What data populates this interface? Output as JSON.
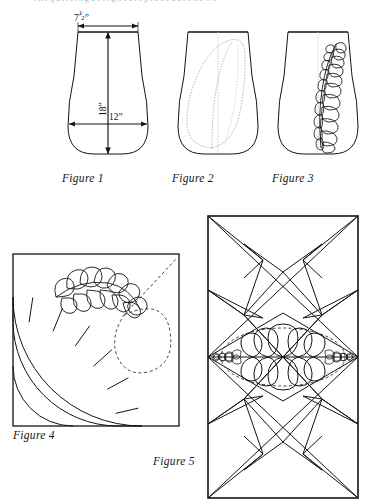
{
  "page": {
    "background": "#ffffff",
    "ink": "#141414",
    "dotted_ink": "#8f8f8f",
    "width": 371,
    "height": 504,
    "cut_off_header_text": "t h e   q u i l t i n g   d e s i g n s   a r e   p l a c e d   a s   s h o w n"
  },
  "figures": [
    {
      "id": "figure-1",
      "caption": "Figure 1",
      "kind": "vase-outline-with-dimensions",
      "description": "Bell / vase shaped quilting block outline with measurement arrows",
      "dimensions": [
        {
          "name": "top-width",
          "value": "7",
          "fraction_numerator": "1",
          "fraction_denominator": "2",
          "unit": "”",
          "orientation": "horizontal",
          "position": "top"
        },
        {
          "name": "height",
          "value": "18",
          "unit": "”",
          "orientation": "vertical",
          "position": "center"
        },
        {
          "name": "bottom-width",
          "value": "12",
          "unit": "”",
          "orientation": "horizontal",
          "position": "lower"
        }
      ]
    },
    {
      "id": "figure-2",
      "caption": "Figure 2",
      "kind": "vase-outline-with-dotted-feather-guide",
      "description": "Same vase outline with dotted teardrop feather placement guide and dotted center line"
    },
    {
      "id": "figure-3",
      "caption": "Figure 3",
      "kind": "vase-outline-with-drawn-feather-plume",
      "description": "Same vase outline with the finished feather plume drawn in along the right of the center line"
    },
    {
      "id": "figure-4",
      "caption": "Figure 4",
      "kind": "fan-block-with-corner-feather",
      "description": "Square pieced fan block, quarter circle of radial wedges from the lower-left corner, with a curved feather plume and dashed placement guides in the upper-right corner",
      "fan_segments": 7
    },
    {
      "id": "figure-5",
      "caption": "Figure 5",
      "kind": "rectangular-panel-with-feather-wreath",
      "description": "Tall rectangular quilt panel with crossed geometric straight-line quilting and a central feathered oval wreath"
    }
  ],
  "captions": {
    "fig1": "Figure 1",
    "fig2": "Figure 2",
    "fig3": "Figure 3",
    "fig4": "Figure 4",
    "fig5": "Figure 5"
  },
  "labels": {
    "top_width_whole": "7",
    "top_width_num": "1",
    "top_width_den": "2",
    "top_width_unit": "”",
    "height": "18”",
    "bottom_width": "12”"
  }
}
